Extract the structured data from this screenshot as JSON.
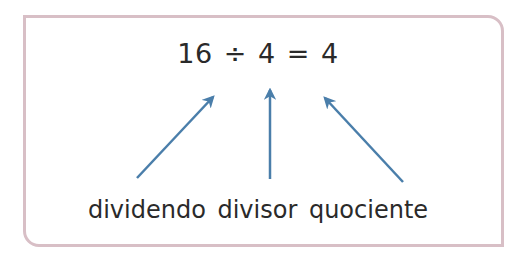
{
  "equation": {
    "dividend": "16",
    "operator": "÷",
    "divisor": "4",
    "equals": "=",
    "quotient": "4"
  },
  "labels": {
    "dividend": "dividendo",
    "divisor": "divisor",
    "quotient": "quociente"
  },
  "colors": {
    "frame_border": "#d8bfc6",
    "arrow": "#4a7eaa",
    "text": "#2a2a2a"
  }
}
